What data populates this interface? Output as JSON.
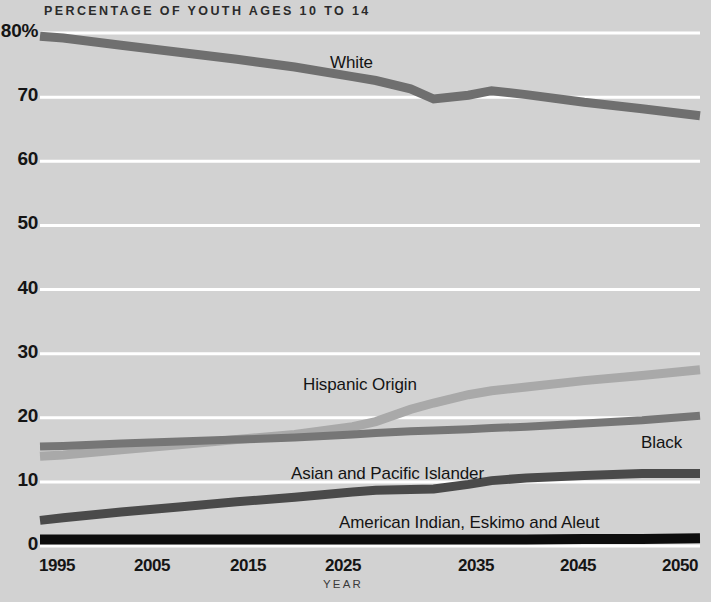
{
  "chart": {
    "title": "PERCENTAGE OF YOUTH AGES  10 TO 14",
    "xlabel": "YEAR",
    "ylabel": ""
  },
  "axis": {
    "y_ticks": [
      "80%",
      "70",
      "60",
      "50",
      "40",
      "30",
      "20",
      "10",
      "0"
    ],
    "x_ticks": [
      "1995",
      "2005",
      "2015",
      "2025",
      "2035",
      "2045",
      "2050"
    ]
  },
  "series_labels": {
    "white": "White",
    "hispanic": "Hispanic Origin",
    "black": "Black",
    "asian": "Asian and Pacific Islander",
    "amerindian": "American Indian, Eskimo and Aleut"
  },
  "colors": {
    "background": "#d2d2d2",
    "gridline": "#ffffff",
    "white_series": "#6f6f6f",
    "hispanic_series": "#a9a9a9",
    "black_series": "#767676",
    "asian_series": "#4a4a4a",
    "amerindian_series": "#0d0d0d",
    "text": "#151515"
  },
  "chart_data": {
    "type": "line",
    "title": "PERCENTAGE OF YOUTH AGES 10 TO 14",
    "xlabel": "YEAR",
    "ylabel": "Percentage of youth ages 10 to 14",
    "xlim": [
      1993,
      2050
    ],
    "ylim": [
      0,
      80
    ],
    "grid": true,
    "legend": "inline-labels",
    "x": [
      1993,
      1995,
      2000,
      2005,
      2010,
      2015,
      2020,
      2022,
      2025,
      2027,
      2030,
      2032,
      2035,
      2040,
      2045,
      2050
    ],
    "series": [
      {
        "name": "White",
        "color": "#6f6f6f",
        "values": [
          79.5,
          79.2,
          78.1,
          77.0,
          75.9,
          74.7,
          73.2,
          72.6,
          71.3,
          69.7,
          70.3,
          71.0,
          70.4,
          69.2,
          68.2,
          67.1
        ]
      },
      {
        "name": "Hispanic Origin",
        "color": "#a9a9a9",
        "values": [
          14.0,
          14.2,
          15.0,
          15.8,
          16.6,
          17.4,
          18.6,
          19.4,
          21.3,
          22.3,
          23.6,
          24.2,
          24.8,
          25.8,
          26.6,
          27.5
        ]
      },
      {
        "name": "Black",
        "color": "#767676",
        "values": [
          15.5,
          15.6,
          16.0,
          16.3,
          16.6,
          16.9,
          17.4,
          17.6,
          17.9,
          18.0,
          18.2,
          18.4,
          18.6,
          19.1,
          19.6,
          20.3
        ]
      },
      {
        "name": "Asian and Pacific Islander",
        "color": "#4a4a4a",
        "values": [
          4.0,
          4.4,
          5.3,
          6.1,
          6.9,
          7.6,
          8.4,
          8.7,
          8.8,
          8.9,
          9.6,
          10.2,
          10.6,
          11.0,
          11.3,
          11.3
        ]
      },
      {
        "name": "American Indian, Eskimo and Aleut",
        "color": "#0d0d0d",
        "values": [
          1.0,
          1.0,
          1.0,
          1.0,
          1.0,
          1.0,
          1.0,
          1.0,
          1.0,
          1.0,
          1.0,
          1.0,
          1.0,
          1.1,
          1.1,
          1.2
        ]
      }
    ]
  },
  "geometry": {
    "plot_left": 40,
    "plot_right": 700,
    "y_top_px": 33,
    "y_bottom_px": 546,
    "y_max": 80,
    "x_min": 1993,
    "x_max": 2050,
    "y_tick_values": [
      80,
      70,
      60,
      50,
      40,
      30,
      20,
      10,
      0
    ],
    "x_tick_values": [
      1995,
      2005,
      2015,
      2025,
      2035,
      2045,
      2050
    ],
    "x_tick_px": [
      57,
      152,
      248,
      343,
      476,
      578,
      680
    ]
  }
}
